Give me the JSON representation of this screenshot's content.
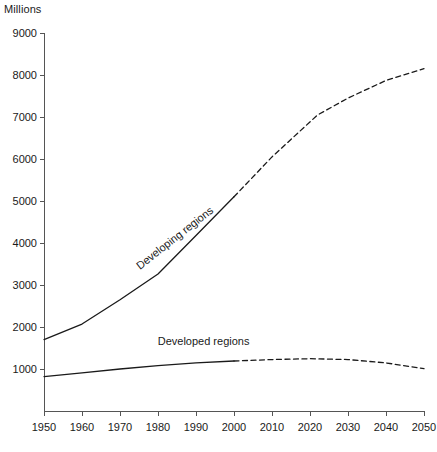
{
  "chart_data": {
    "type": "line",
    "title": "",
    "unit_label": "Millions",
    "xlabel": "",
    "ylabel": "",
    "xlim": [
      1950,
      2050
    ],
    "ylim": [
      0,
      9000
    ],
    "grid": false,
    "legend_position": "inline-labels",
    "x_ticks": [
      1950,
      1960,
      1970,
      1980,
      1990,
      2000,
      2010,
      2020,
      2030,
      2040,
      2050
    ],
    "y_ticks": [
      1000,
      2000,
      3000,
      4000,
      5000,
      6000,
      7000,
      8000,
      9000
    ],
    "projection_start_year": 2000,
    "series": [
      {
        "name": "Developing regions",
        "label_rotation_deg": -38,
        "label_anchor_year": 1985,
        "label_anchor_value": 4050,
        "x": [
          1950,
          1960,
          1970,
          1980,
          1990,
          2000,
          2010,
          2022,
          2030,
          2040,
          2050
        ],
        "values": [
          1700,
          2070,
          2650,
          3260,
          4180,
          5100,
          6050,
          7050,
          7450,
          7870,
          8150
        ]
      },
      {
        "name": "Developed regions",
        "label_rotation_deg": 0,
        "label_anchor_year": 1992,
        "label_anchor_value": 1560,
        "x": [
          1950,
          1960,
          1970,
          1980,
          1990,
          2000,
          2010,
          2020,
          2030,
          2040,
          2050
        ],
        "values": [
          820,
          910,
          1000,
          1080,
          1145,
          1190,
          1225,
          1245,
          1225,
          1145,
          1010
        ]
      }
    ]
  }
}
